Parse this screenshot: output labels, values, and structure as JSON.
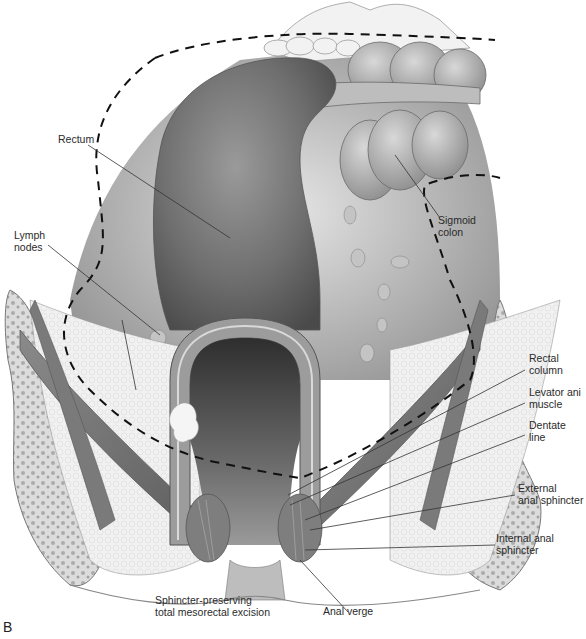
{
  "figure": {
    "panel_letter": "B",
    "caption": "Sphincter-preserving\ntotal mesorectal excision",
    "colors": {
      "background": "#ffffff",
      "tissue_dark": "#5a5a5a",
      "tissue_mid": "#8c8c8c",
      "tissue_light": "#c8c8c8",
      "fat": "#eeeeee",
      "bone": "#e4e4e4",
      "dashed_line": "#111111",
      "leader_line": "#333333"
    },
    "labels": {
      "rectum": "Rectum",
      "lymph_nodes": "Lymph\nnodes",
      "sigmoid_colon": "Sigmoid\ncolon",
      "rectal_column": "Rectal\ncolumn",
      "levator_ani": "Levator ani\nmuscle",
      "dentate_line": "Dentate\nline",
      "external_sphincter": "External\nanal sphincter",
      "internal_sphincter": "Internal anal\nsphincter",
      "anal_verge": "Anal verge"
    }
  }
}
